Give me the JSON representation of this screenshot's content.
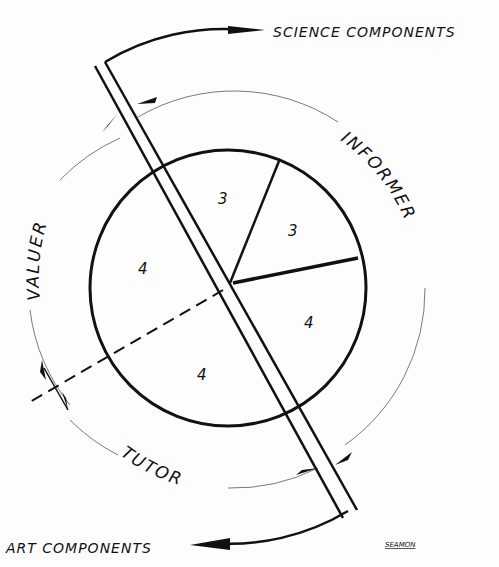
{
  "diagram": {
    "top_label": "SCIENCE COMPONENTS",
    "bottom_label": "ART COMPONENTS",
    "arc_labels": {
      "informer": "INFORMER",
      "valuer": "VALUER",
      "tutor": "TUTOR"
    },
    "segments": [
      {
        "position": "top",
        "value": "3"
      },
      {
        "position": "upper-right",
        "value": "3"
      },
      {
        "position": "lower-right",
        "value": "4"
      },
      {
        "position": "bottom",
        "value": "4"
      },
      {
        "position": "left",
        "value": "4"
      }
    ],
    "signature": "SEAMON"
  },
  "colors": {
    "ink": "#111111",
    "paper": "#fdfdfd"
  }
}
